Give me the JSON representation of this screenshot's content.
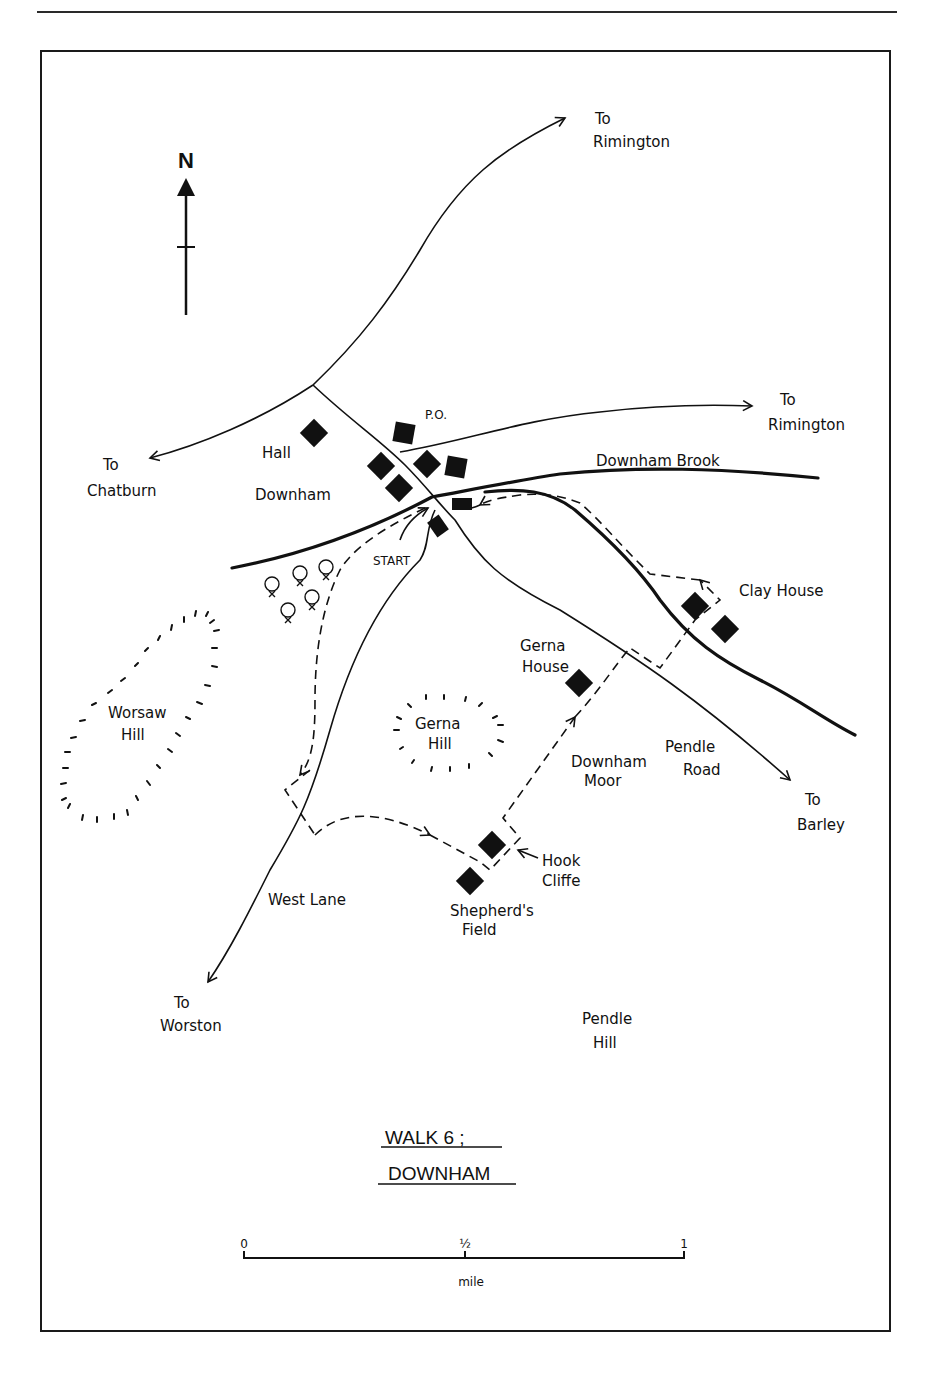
{
  "map": {
    "title_line1": "WALK 6 ;",
    "title_line2": "DOWNHAM",
    "north_label": "N",
    "labels": {
      "to_rimington_top_1": "To",
      "to_rimington_top_2": "Rimington",
      "to_rimington_mid_1": "To",
      "to_rimington_mid_2": "Rimington",
      "to_chatburn_1": "To",
      "to_chatburn_2": "Chatburn",
      "hall": "Hall",
      "downham": "Downham",
      "po": "P.O.",
      "downham_brook": "Downham Brook",
      "start": "START",
      "clay_house": "Clay House",
      "gerna_house_1": "Gerna",
      "gerna_house_2": "House",
      "worsaw_hill_1": "Worsaw",
      "worsaw_hill_2": "Hill",
      "gerna_hill_1": "Gerna",
      "gerna_hill_2": "Hill",
      "downham_moor_1": "Downham",
      "downham_moor_2": "Moor",
      "pendle_road_1": "Pendle",
      "pendle_road_2": "Road",
      "to_barley_1": "To",
      "to_barley_2": "Barley",
      "hook_cliffe_1": "Hook",
      "hook_cliffe_2": "Cliffe",
      "west_lane": "West Lane",
      "shepherds_field_1": "Shepherd's",
      "shepherds_field_2": "Field",
      "to_worston_1": "To",
      "to_worston_2": "Worston",
      "pendle_hill_1": "Pendle",
      "pendle_hill_2": "Hill"
    },
    "scale": {
      "tick_0": "0",
      "tick_half": "½",
      "tick_1": "1",
      "unit": "mile"
    },
    "legend_symbols": {
      "building": "filled-square",
      "road": "thin-line",
      "brook": "thick-line",
      "walk_route": "dashed-line",
      "hill": "hachure-ring",
      "trees": "tree-cluster"
    }
  }
}
